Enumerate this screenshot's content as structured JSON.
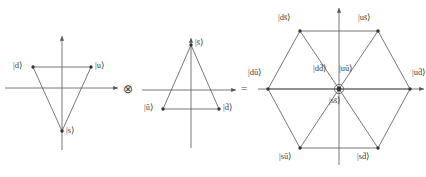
{
  "figure": {
    "background_color": "#ffffff",
    "line_color": "#555555",
    "text_color": "#3d3d3d",
    "width": 426,
    "height": 177
  },
  "operators": {
    "tensor": "⊗",
    "equals": "="
  },
  "panels": {
    "quark": {
      "name": "quark-triplet-diagram",
      "shape": "inverted-triangle",
      "axes": {
        "horizontal": true,
        "vertical": true
      },
      "vertices": [
        {
          "id": "d",
          "label": "|d⟩",
          "position": "upper-left"
        },
        {
          "id": "u",
          "label": "|u⟩",
          "position": "upper-right"
        },
        {
          "id": "s",
          "label": "|s⟩",
          "position": "bottom-center"
        }
      ]
    },
    "antiquark": {
      "name": "antiquark-triplet-diagram",
      "shape": "upright-triangle",
      "axes": {
        "horizontal": true,
        "vertical": true
      },
      "vertices": [
        {
          "id": "sbar",
          "label": "|s̄⟩",
          "position": "top-center"
        },
        {
          "id": "ubar",
          "label": "|ū⟩",
          "position": "lower-left"
        },
        {
          "id": "dbar",
          "label": "|d̄⟩",
          "position": "lower-right"
        }
      ]
    },
    "meson": {
      "name": "meson-nonet-hexagon-diagram",
      "shape": "hexagon-with-center",
      "axes": {
        "horizontal": true,
        "vertical": true
      },
      "vertices": [
        {
          "id": "dsbar",
          "label": "|ds̄⟩",
          "position": "top-left"
        },
        {
          "id": "usbar",
          "label": "|us̄⟩",
          "position": "top-right"
        },
        {
          "id": "dubar",
          "label": "|dū⟩",
          "position": "left"
        },
        {
          "id": "udbar",
          "label": "|ud̄⟩",
          "position": "right"
        },
        {
          "id": "subar",
          "label": "|sū⟩",
          "position": "bottom-left"
        },
        {
          "id": "sdbar",
          "label": "|sd̄⟩",
          "position": "bottom-right"
        }
      ],
      "center_states": [
        {
          "id": "ddbar",
          "label": "|dd̄⟩",
          "position": "center-left"
        },
        {
          "id": "uubar",
          "label": "|uū⟩",
          "position": "center-right"
        },
        {
          "id": "ssbar",
          "label": "|ss̄⟩",
          "position": "center-below"
        }
      ]
    }
  }
}
